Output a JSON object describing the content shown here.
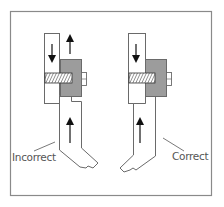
{
  "diagram": {
    "colors": {
      "frame": "#8a8a8a",
      "outline": "#6a6a6a",
      "block_fill": "#9c9c9c",
      "hatch": "#333333",
      "arrow": "#111111",
      "label": "#555555"
    },
    "figures": [
      {
        "id": "incorrect",
        "label": "Incorrect",
        "upper_arrow_direction": "down",
        "block_arrow_direction": "up",
        "lower_arrow_direction": "up"
      },
      {
        "id": "correct",
        "label": "Correct",
        "upper_arrow_direction": "down",
        "block_arrow_direction": "up",
        "lower_arrow_direction": "up"
      }
    ]
  }
}
